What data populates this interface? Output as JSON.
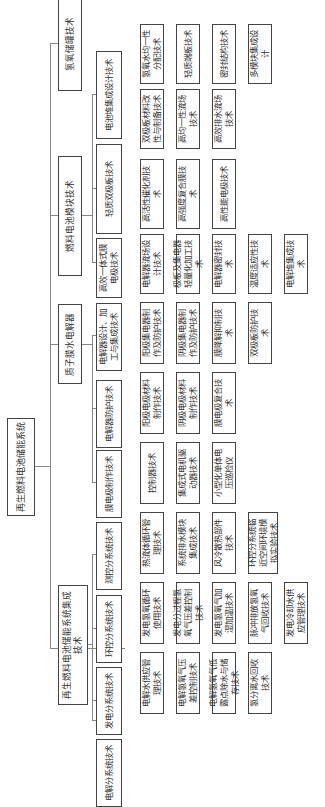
{
  "diagram": {
    "root": {
      "label": "再生燃料电池储能系统"
    },
    "level1": [
      {
        "id": "a",
        "label": "氢氧储罐技术"
      },
      {
        "id": "b",
        "label": "燃料电池模块技术"
      },
      {
        "id": "c",
        "label": "质子膜水电解器"
      },
      {
        "id": "d",
        "label": "再生燃料电池储能系统集成技术"
      }
    ],
    "level2": [
      {
        "id": "b1",
        "parent": "b",
        "label": "电池堆集成设计技术"
      },
      {
        "id": "b2",
        "parent": "b",
        "label": "轻质双极板技术"
      },
      {
        "id": "b3",
        "parent": "b",
        "label": "高效一体式膜电极技术"
      },
      {
        "id": "c1",
        "parent": "c",
        "label": "电解器设计、加工与集成技术"
      },
      {
        "id": "c2",
        "parent": "c",
        "label": "电解器防护技术"
      },
      {
        "id": "c3",
        "parent": "c",
        "label": "膜电极制作技术"
      },
      {
        "id": "d1",
        "parent": "d",
        "label": "测控分系统技术"
      },
      {
        "id": "d2",
        "parent": "d",
        "label": "环控分系统技术"
      },
      {
        "id": "d3",
        "parent": "d",
        "label": "发电分系统技术"
      },
      {
        "id": "d4",
        "parent": "d",
        "label": "电解分系统技术"
      }
    ],
    "level3": {
      "b1": [
        "氢氧水均一性分配技术",
        "轻质端板技术",
        "密封结构技术",
        "多模块集成设计"
      ],
      "b2": [
        "双极板材料改性与制备技术",
        "高均一性流场技术",
        "高效排水流场技术"
      ],
      "b3": [
        "高活性催化剂技术",
        "高强度复合膜技术",
        "高性能电极技术"
      ],
      "c1": [
        "电解器流场设计技术",
        "极板及集电器轻量化加工技术",
        "电解器密封技术",
        "温度适应性技术",
        "电解堆集成技术"
      ],
      "c2": [
        "阳极集电器制作及防护技术",
        "阴极集电器制作及防护技术",
        "膜降解抑制技术",
        "双极板防护技术"
      ],
      "c3": [
        "阳极电极材料制作技术",
        "阴极电极材料制作技术",
        "膜电极复合技术"
      ],
      "d1": [
        "控制器技术",
        "集成式电机驱动器技术",
        "小型化单体电压巡检仪"
      ],
      "d2": [
        "热流体循环管理技术",
        "系统排水模块集成技术",
        "风冷散热部件技术",
        "环控分系统临近空间环境模拟实验技术"
      ],
      "d3": [
        "发电氢氧循环使用技术",
        "发电分过程氢氧气压差控制技术",
        "发电氢氧气加湿加温技术",
        "脉冲排放氢氧气回收技术",
        "发电冷却水供应管理技术"
      ],
      "d4": [
        "电解水供应管理技术",
        "电解氢氧气压差控制技术",
        "电解氢氧气低露点除水与储存技术",
        "氢分离水回收技术"
      ]
    }
  }
}
